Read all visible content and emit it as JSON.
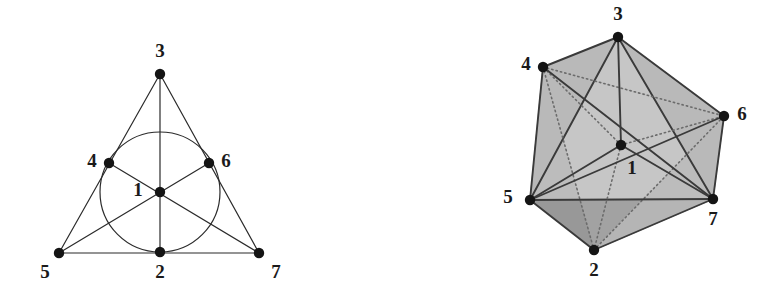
{
  "figure": {
    "caption": "",
    "colors": {
      "ink": "#2b2b2b",
      "node_fill": "#141414",
      "label": "#1a1a1a",
      "face_light": "#b9b9b9",
      "face_mid": "#a3a3a3",
      "face_dark": "#8e8e8e",
      "background": "#ffffff"
    },
    "panels": [
      {
        "name": "fano-plane",
        "type": "2d-incidence-diagram",
        "description": "Fano plane: 7 points, 7 lines (6 straight lines and 1 circle)",
        "points": [
          {
            "id": "1",
            "label": "1",
            "x": 160,
            "y": 192,
            "label_x": 138,
            "label_y": 192
          },
          {
            "id": "2",
            "label": "2",
            "x": 160,
            "y": 252,
            "label_x": 160,
            "label_y": 274
          },
          {
            "id": "3",
            "label": "3",
            "x": 160,
            "y": 74,
            "label_x": 160,
            "label_y": 53
          },
          {
            "id": "4",
            "label": "4",
            "x": 109,
            "y": 163,
            "label_x": 92,
            "label_y": 163
          },
          {
            "id": "5",
            "label": "5",
            "x": 59,
            "y": 253,
            "label_x": 45,
            "label_y": 274
          },
          {
            "id": "6",
            "label": "6",
            "x": 209,
            "y": 163,
            "label_x": 226,
            "label_y": 163
          },
          {
            "id": "7",
            "label": "7",
            "x": 259,
            "y": 253,
            "label_x": 276,
            "label_y": 274
          }
        ],
        "lines": [
          {
            "name": "line-3-1-2",
            "points": [
              "3",
              "1",
              "2"
            ]
          },
          {
            "name": "line-3-4-5",
            "points": [
              "3",
              "4",
              "5"
            ]
          },
          {
            "name": "line-3-6-7",
            "points": [
              "3",
              "6",
              "7"
            ]
          },
          {
            "name": "line-5-2-7",
            "points": [
              "5",
              "2",
              "7"
            ]
          },
          {
            "name": "line-4-1-7",
            "points": [
              "4",
              "1",
              "7"
            ]
          },
          {
            "name": "line-5-1-6",
            "points": [
              "5",
              "1",
              "6"
            ]
          }
        ],
        "circle": {
          "name": "line-4-6-2-circle",
          "points": [
            "4",
            "6",
            "2"
          ],
          "cx": 160,
          "cy": 192,
          "r": 60
        }
      },
      {
        "name": "polytope-3d",
        "type": "3d-polytope-diagram",
        "description": "Shaded 3-dimensional polytope with 7 labelled vertices and internal edges",
        "points": [
          {
            "id": "1",
            "label": "1",
            "x": 621,
            "y": 145,
            "label_x": 632,
            "label_y": 170
          },
          {
            "id": "2",
            "label": "2",
            "x": 594,
            "y": 250,
            "label_x": 594,
            "label_y": 272
          },
          {
            "id": "3",
            "label": "3",
            "x": 618,
            "y": 37,
            "label_x": 618,
            "label_y": 16
          },
          {
            "id": "4",
            "label": "4",
            "x": 543,
            "y": 67,
            "label_x": 526,
            "label_y": 66
          },
          {
            "id": "5",
            "label": "5",
            "x": 530,
            "y": 200,
            "label_x": 508,
            "label_y": 199
          },
          {
            "id": "6",
            "label": "6",
            "x": 724,
            "y": 116,
            "label_x": 742,
            "label_y": 116
          },
          {
            "id": "7",
            "label": "7",
            "x": 713,
            "y": 199,
            "label_x": 713,
            "label_y": 221
          }
        ],
        "faces": [
          {
            "name": "face-3-4-5",
            "points": [
              "3",
              "4",
              "5"
            ],
            "shade": "face_mid"
          },
          {
            "name": "face-3-6-7",
            "points": [
              "3",
              "6",
              "7"
            ],
            "shade": "face_mid"
          },
          {
            "name": "face-4-5-2",
            "points": [
              "4",
              "5",
              "2"
            ],
            "shade": "face_light"
          },
          {
            "name": "face-5-2-7",
            "points": [
              "5",
              "2",
              "7"
            ],
            "shade": "face_dark"
          },
          {
            "name": "face-2-7-6",
            "points": [
              "2",
              "7",
              "6"
            ],
            "shade": "face_light"
          },
          {
            "name": "face-3-4-6",
            "points": [
              "3",
              "4",
              "6"
            ],
            "shade": "face_light"
          },
          {
            "name": "face-4-6-7-5",
            "points": [
              "4",
              "6",
              "7",
              "5"
            ],
            "shade": "face_light"
          }
        ],
        "edges": [
          {
            "name": "edge-3-4",
            "points": [
              "3",
              "4"
            ],
            "style": "solid"
          },
          {
            "name": "edge-3-6",
            "points": [
              "3",
              "6"
            ],
            "style": "solid"
          },
          {
            "name": "edge-3-5",
            "points": [
              "3",
              "5"
            ],
            "style": "solid"
          },
          {
            "name": "edge-3-7",
            "points": [
              "3",
              "7"
            ],
            "style": "solid"
          },
          {
            "name": "edge-4-5",
            "points": [
              "4",
              "5"
            ],
            "style": "solid"
          },
          {
            "name": "edge-6-7",
            "points": [
              "6",
              "7"
            ],
            "style": "solid"
          },
          {
            "name": "edge-5-2",
            "points": [
              "5",
              "2"
            ],
            "style": "solid"
          },
          {
            "name": "edge-2-7",
            "points": [
              "2",
              "7"
            ],
            "style": "solid"
          },
          {
            "name": "edge-4-2",
            "points": [
              "4",
              "2"
            ],
            "style": "dotted"
          },
          {
            "name": "edge-2-6",
            "points": [
              "2",
              "6"
            ],
            "style": "dotted"
          },
          {
            "name": "edge-4-6",
            "points": [
              "4",
              "6"
            ],
            "style": "dotted"
          },
          {
            "name": "edge-5-7",
            "points": [
              "5",
              "7"
            ],
            "style": "solid"
          },
          {
            "name": "edge-3-1",
            "points": [
              "3",
              "1"
            ],
            "style": "solid"
          },
          {
            "name": "edge-1-2",
            "points": [
              "1",
              "2"
            ],
            "style": "dotted"
          },
          {
            "name": "edge-1-5",
            "points": [
              "1",
              "5"
            ],
            "style": "solid"
          },
          {
            "name": "edge-1-7",
            "points": [
              "1",
              "7"
            ],
            "style": "solid"
          },
          {
            "name": "edge-1-4",
            "points": [
              "1",
              "4"
            ],
            "style": "dotted"
          },
          {
            "name": "edge-1-6",
            "points": [
              "1",
              "6"
            ],
            "style": "dotted"
          },
          {
            "name": "chord-4-7",
            "points": [
              "4",
              "7"
            ],
            "style": "solid"
          },
          {
            "name": "chord-5-6",
            "points": [
              "5",
              "6"
            ],
            "style": "solid"
          }
        ]
      }
    ]
  }
}
